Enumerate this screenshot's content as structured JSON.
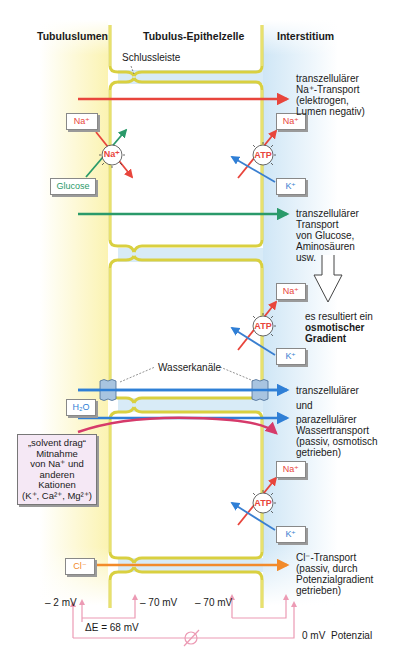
{
  "headers": {
    "lumen": "Tubuluslumen",
    "cell": "Tubulus-Epithelzelle",
    "interstitium": "Interstitium"
  },
  "labels": {
    "tight_junction": "Schlussleiste",
    "water_channels": "Wasserkanäle"
  },
  "ions": {
    "na_lumen": "Na⁺",
    "glucose": "Glucose",
    "na_transporter": "Na⁺",
    "atp": "ATP",
    "na_inter_1": "Na⁺",
    "k_inter_1": "K⁺",
    "na_inter_2": "Na⁺",
    "k_inter_2": "K⁺",
    "na_inter_3": "Na⁺",
    "k_inter_3": "K⁺",
    "h2o": "H₂O",
    "cl": "Cl⁻"
  },
  "descriptions": {
    "na_transport": [
      "transzellulärer",
      "Na⁺-Transport",
      "(elektrogen,",
      "Lumen negativ)"
    ],
    "glucose_transport": [
      "transzellulärer",
      "Transport",
      "von Glucose,",
      "Aminosäuren",
      "usw."
    ],
    "osmotic": [
      "es resultiert ein",
      "osmotischer",
      "Gradient"
    ],
    "water_1": "transzellulärer",
    "water_2": "und",
    "water_3": [
      "parazellulärer",
      "Wassertransport",
      "(passiv, osmotisch",
      "getrieben)"
    ],
    "cl_transport": [
      "Cl⁻-Transport",
      "(passiv, durch",
      "Potenzialgradient",
      "getrieben)"
    ]
  },
  "solvent_drag": [
    "„solvent drag“",
    "Mitnahme",
    "von Na⁺ und",
    "anderen",
    "Kationen",
    "(K⁺, Ca²⁺, Mg²⁺)"
  ],
  "potentials": {
    "lumen": "– 2 mV",
    "cell_apical": "– 70 mV",
    "cell_basal": "– 70 mV",
    "delta": "ΔE = 68 mV",
    "interstitium": "0 mV",
    "label": "Potenzial"
  },
  "colors": {
    "na": "#e8453c",
    "glucose": "#2a9a6a",
    "k": "#3a7fd0",
    "water": "#2f7fd6",
    "solvent": "#d63a6a",
    "cl": "#f28a2a",
    "membrane": "#e8e25a",
    "potential": "#ec9ab4"
  }
}
